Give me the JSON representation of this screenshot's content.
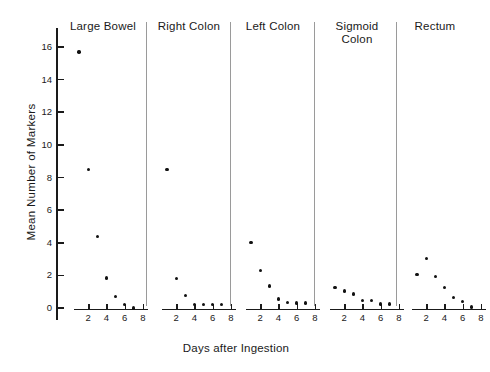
{
  "chart_data": {
    "type": "scatter",
    "title": "",
    "xlabel": "Days after Ingestion",
    "ylabel": "Mean Number of Markers",
    "xlim": [
      0,
      9
    ],
    "ylim": [
      -0.9,
      17.2
    ],
    "xticks": [
      2,
      4,
      6,
      8
    ],
    "yticks": [
      0,
      2,
      4,
      6,
      8,
      10,
      12,
      14,
      16
    ],
    "xticklabels": [
      "2",
      "4",
      "6",
      "8"
    ],
    "yticklabels": [
      "0",
      "2",
      "4",
      "6",
      "8",
      "10",
      "12",
      "14",
      "16"
    ],
    "grid": false,
    "legend": null,
    "layout": "5 panels sharing one y-axis, separated by thin vertical rules",
    "panels": [
      {
        "label": "Large Bowel",
        "x": [
          1,
          2,
          3,
          4,
          5,
          6,
          7
        ],
        "y": [
          15.7,
          8.5,
          4.4,
          1.85,
          0.7,
          0.2,
          0.0
        ]
      },
      {
        "label": "Right Colon",
        "x": [
          1,
          2,
          3,
          4,
          5,
          6,
          7
        ],
        "y": [
          8.5,
          1.8,
          0.75,
          0.2,
          0.2,
          0.2,
          0.2
        ]
      },
      {
        "label": "Left Colon",
        "x": [
          1,
          2,
          3,
          4,
          5,
          6,
          7
        ],
        "y": [
          4.0,
          2.3,
          1.35,
          0.55,
          0.35,
          0.3,
          0.3
        ]
      },
      {
        "label": "Sigmoid\nColon",
        "x": [
          1,
          2,
          3,
          4,
          5,
          6,
          7
        ],
        "y": [
          1.25,
          1.05,
          0.85,
          0.45,
          0.45,
          0.25,
          0.25
        ]
      },
      {
        "label": "Rectum",
        "x": [
          1,
          2,
          3,
          4,
          5,
          6,
          7
        ],
        "y": [
          2.05,
          3.05,
          1.95,
          1.25,
          0.65,
          0.4,
          0.05
        ]
      }
    ]
  },
  "style": {
    "point_color": "#111111",
    "axis_color": "#1a1a1a",
    "separator_color": "#9a9a9a",
    "background": "#ffffff"
  }
}
